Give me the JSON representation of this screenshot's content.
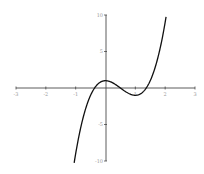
{
  "chart_data": {
    "type": "line",
    "title": "",
    "xlabel": "",
    "ylabel": "",
    "xlim": [
      -3,
      3
    ],
    "ylim": [
      -10,
      10
    ],
    "grid": false,
    "legend": null,
    "axes_style": "crossing at origin",
    "x_ticks": [
      -3,
      -2,
      -1,
      1,
      2,
      3
    ],
    "x_tick_labels": [
      "-3",
      "-2",
      "-1",
      "1",
      "2",
      "3"
    ],
    "y_ticks": [
      -10,
      -5,
      5,
      10
    ],
    "y_tick_labels": [
      "-10",
      "-5",
      "5",
      "10"
    ],
    "series": [
      {
        "name": "f(x)",
        "expression": "4x^3 - 6x^2 + 1",
        "domain": [
          -1.05,
          2.03
        ],
        "color": "#000000",
        "x": [
          -1.05,
          -1.0,
          -0.8,
          -0.6,
          -0.4,
          -0.37,
          -0.2,
          0.0,
          0.2,
          0.4,
          0.5,
          0.6,
          0.8,
          1.0,
          1.2,
          1.37,
          1.5,
          1.7,
          1.9,
          2.0,
          2.03
        ],
        "y": [
          -10.25,
          -9.0,
          -5.89,
          -2.02,
          0.1,
          0.0,
          0.73,
          1.0,
          0.79,
          0.3,
          0.0,
          -0.3,
          -0.79,
          -1.0,
          -0.73,
          0.0,
          1.0,
          3.31,
          7.78,
          9.0,
          10.0
        ]
      }
    ],
    "annotations": []
  },
  "plot": {
    "x_axis_color": "#333333",
    "y_axis_color": "#333333",
    "curve_color": "#111111"
  }
}
